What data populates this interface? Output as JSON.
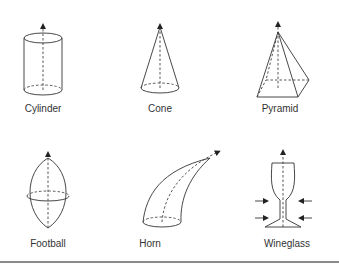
{
  "figure": {
    "shapes": [
      {
        "id": "cylinder",
        "label": "Cylinder"
      },
      {
        "id": "cone",
        "label": "Cone"
      },
      {
        "id": "pyramid",
        "label": "Pyramid"
      },
      {
        "id": "football",
        "label": "Football"
      },
      {
        "id": "horn",
        "label": "Horn"
      },
      {
        "id": "wineglass",
        "label": "Wineglass"
      }
    ]
  },
  "colors": {
    "line": "#333333",
    "rule": "#8a8a8a",
    "background": "#ffffff"
  }
}
